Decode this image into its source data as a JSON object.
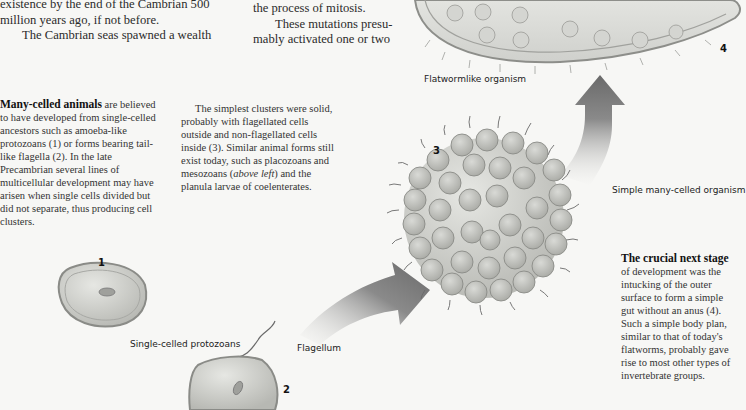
{
  "top_text": {
    "col1": {
      "line1": "existence by the end of the Cambrian 500",
      "line2": "million years ago, if not before.",
      "line3": "The Cambrian seas spawned a wealth"
    },
    "col2": {
      "line1": "the process of mitosis.",
      "line2": "These mutations presu-",
      "line3": "mably activated one or two"
    }
  },
  "captions": {
    "many_celled": {
      "bold": "Many-celled animals",
      "text": " are believed to have developed from single-celled ancestors such as amoeba-like protozoans (1) or forms bearing tail-like flagella (2). In the late Precambrian several lines of multicellular development may have arisen when single cells divided but did not separate, thus producing cell clusters."
    },
    "simplest_clusters": {
      "text_before": "The simplest clusters were solid, probably with flagellated cells outside and non-flagellated cells inside (3). Similar animal forms still exist today, such as placozoans and mesozoans (",
      "italic": "above left",
      "text_after": ") and the planula larvae of coelenterates."
    },
    "crucial_next": {
      "bold": "The crucial next stage",
      "text": " of development was the intucking of the outer surface to form a simple gut without an anus (4). Such a simple body plan, similar to that of today's flatworms, probably gave rise to most other types of invertebrate groups."
    }
  },
  "labels": {
    "flatwormlike": "Flatwormlike organism",
    "simple_many_celled": "Simple many-celled organism",
    "single_celled": "Single-celled protozoans",
    "flagellum": "Flagellum"
  },
  "numbers": {
    "n1": "1",
    "n2": "2",
    "n3": "3",
    "n4": "4"
  },
  "colors": {
    "background": "#f7f7f5",
    "cell_fill": "#c9cac6",
    "cell_edge": "#8a8b87",
    "arrow_dark": "#6e6e6e",
    "arrow_light": "#f2f2f2"
  }
}
